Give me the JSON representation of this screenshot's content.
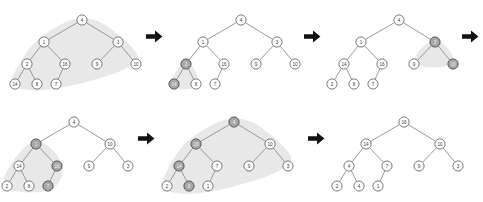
{
  "figure": {
    "colors": {
      "background": "#ffffff",
      "node_fill": "#ffffff",
      "node_stroke": "#6e6e6e",
      "node_fill_highlighted": "#a8a8a8",
      "node_label": "#3a3a3a",
      "node_label_highlighted": "#f2f2f2",
      "edge": "#8f8f8f",
      "blob": "#e6e6e6",
      "arrow": "#111111"
    },
    "arrows": [
      {
        "name": "arrow-1",
        "glyph": "right-arrow",
        "row": "top",
        "after_panel": 1
      },
      {
        "name": "arrow-2",
        "glyph": "right-arrow",
        "row": "top",
        "after_panel": 2
      },
      {
        "name": "arrow-3",
        "glyph": "right-arrow",
        "row": "top",
        "after_panel": 3
      },
      {
        "name": "arrow-4",
        "glyph": "right-arrow",
        "row": "bottom",
        "after_panel": 4
      },
      {
        "name": "arrow-5",
        "glyph": "right-arrow",
        "row": "bottom",
        "after_panel": 5
      }
    ]
  },
  "chart_data": {
    "type": "diagram",
    "panel_count": 6,
    "panels": [
      {
        "index": 1,
        "name": "panel-step-1",
        "row": "top",
        "highlighted": [
          "16",
          "7"
        ],
        "blob_region": "subtree rooted at 16",
        "nodes": [
          {
            "id": "n0",
            "label": "4",
            "x": 86,
            "y": 18,
            "highlight": false
          },
          {
            "id": "n1",
            "label": "1",
            "x": 48,
            "y": 40,
            "highlight": false
          },
          {
            "id": "n2",
            "label": "3",
            "x": 122,
            "y": 40,
            "highlight": false
          },
          {
            "id": "n3",
            "label": "2",
            "x": 31,
            "y": 62,
            "highlight": false
          },
          {
            "id": "n4",
            "label": "16",
            "x": 69,
            "y": 62,
            "highlight": false
          },
          {
            "id": "n5",
            "label": "9",
            "x": 101,
            "y": 62,
            "highlight": false
          },
          {
            "id": "n6",
            "label": "10",
            "x": 140,
            "y": 62,
            "highlight": false
          },
          {
            "id": "n7",
            "label": "14",
            "x": 19,
            "y": 82,
            "highlight": false
          },
          {
            "id": "n8",
            "label": "8",
            "x": 41,
            "y": 82,
            "highlight": false
          },
          {
            "id": "n9",
            "label": "7",
            "x": 60,
            "y": 82,
            "highlight": false
          }
        ],
        "edges": [
          [
            "n0",
            "n1"
          ],
          [
            "n0",
            "n2"
          ],
          [
            "n1",
            "n3"
          ],
          [
            "n1",
            "n4"
          ],
          [
            "n2",
            "n5"
          ],
          [
            "n2",
            "n6"
          ],
          [
            "n3",
            "n7"
          ],
          [
            "n3",
            "n8"
          ],
          [
            "n4",
            "n9"
          ]
        ]
      },
      {
        "index": 2,
        "name": "panel-step-2",
        "row": "top",
        "highlighted": [
          "2",
          "14"
        ],
        "blob_region": "subtree rooted at 2",
        "nodes": [
          {
            "id": "n0",
            "label": "4",
            "x": 86,
            "y": 18,
            "highlight": false
          },
          {
            "id": "n1",
            "label": "1",
            "x": 48,
            "y": 40,
            "highlight": false
          },
          {
            "id": "n2",
            "label": "3",
            "x": 122,
            "y": 40,
            "highlight": false
          },
          {
            "id": "n3",
            "label": "2",
            "x": 31,
            "y": 62,
            "highlight": true
          },
          {
            "id": "n4",
            "label": "16",
            "x": 69,
            "y": 62,
            "highlight": false
          },
          {
            "id": "n5",
            "label": "9",
            "x": 101,
            "y": 62,
            "highlight": false
          },
          {
            "id": "n6",
            "label": "10",
            "x": 140,
            "y": 62,
            "highlight": false
          },
          {
            "id": "n7",
            "label": "14",
            "x": 19,
            "y": 82,
            "highlight": true
          },
          {
            "id": "n8",
            "label": "8",
            "x": 41,
            "y": 82,
            "highlight": false
          },
          {
            "id": "n9",
            "label": "7",
            "x": 60,
            "y": 82,
            "highlight": false
          }
        ],
        "edges": [
          [
            "n0",
            "n1"
          ],
          [
            "n0",
            "n2"
          ],
          [
            "n1",
            "n3"
          ],
          [
            "n1",
            "n4"
          ],
          [
            "n2",
            "n5"
          ],
          [
            "n2",
            "n6"
          ],
          [
            "n3",
            "n7"
          ],
          [
            "n3",
            "n8"
          ],
          [
            "n4",
            "n9"
          ]
        ]
      },
      {
        "index": 3,
        "name": "panel-step-3",
        "row": "top",
        "highlighted": [
          "3",
          "10"
        ],
        "blob_region": "subtree rooted at 3",
        "nodes": [
          {
            "id": "n0",
            "label": "4",
            "x": 86,
            "y": 18,
            "highlight": false
          },
          {
            "id": "n1",
            "label": "1",
            "x": 48,
            "y": 40,
            "highlight": false
          },
          {
            "id": "n2",
            "label": "3",
            "x": 122,
            "y": 40,
            "highlight": true
          },
          {
            "id": "n3",
            "label": "14",
            "x": 31,
            "y": 62,
            "highlight": false
          },
          {
            "id": "n4",
            "label": "16",
            "x": 69,
            "y": 62,
            "highlight": false
          },
          {
            "id": "n5",
            "label": "9",
            "x": 101,
            "y": 62,
            "highlight": false
          },
          {
            "id": "n6",
            "label": "10",
            "x": 140,
            "y": 62,
            "highlight": true
          },
          {
            "id": "n7",
            "label": "2",
            "x": 19,
            "y": 82,
            "highlight": false
          },
          {
            "id": "n8",
            "label": "8",
            "x": 41,
            "y": 82,
            "highlight": false
          },
          {
            "id": "n9",
            "label": "7",
            "x": 60,
            "y": 82,
            "highlight": false
          }
        ],
        "edges": [
          [
            "n0",
            "n1"
          ],
          [
            "n0",
            "n2"
          ],
          [
            "n1",
            "n3"
          ],
          [
            "n1",
            "n4"
          ],
          [
            "n2",
            "n5"
          ],
          [
            "n2",
            "n6"
          ],
          [
            "n3",
            "n7"
          ],
          [
            "n3",
            "n8"
          ],
          [
            "n4",
            "n9"
          ]
        ]
      },
      {
        "index": 4,
        "name": "panel-step-4",
        "row": "bottom",
        "highlighted": [
          "1",
          "16",
          "7"
        ],
        "blob_region": "subtree rooted at 1",
        "nodes": [
          {
            "id": "n0",
            "label": "4",
            "x": 86,
            "y": 18,
            "highlight": false
          },
          {
            "id": "n1",
            "label": "1",
            "x": 48,
            "y": 40,
            "highlight": true
          },
          {
            "id": "n2",
            "label": "10",
            "x": 122,
            "y": 40,
            "highlight": false
          },
          {
            "id": "n3",
            "label": "14",
            "x": 31,
            "y": 62,
            "highlight": false
          },
          {
            "id": "n4",
            "label": "16",
            "x": 69,
            "y": 62,
            "highlight": true
          },
          {
            "id": "n5",
            "label": "9",
            "x": 101,
            "y": 62,
            "highlight": false
          },
          {
            "id": "n6",
            "label": "3",
            "x": 140,
            "y": 62,
            "highlight": false
          },
          {
            "id": "n7",
            "label": "2",
            "x": 19,
            "y": 82,
            "highlight": false
          },
          {
            "id": "n8",
            "label": "8",
            "x": 41,
            "y": 82,
            "highlight": false
          },
          {
            "id": "n9",
            "label": "7",
            "x": 60,
            "y": 82,
            "highlight": true
          }
        ],
        "edges": [
          [
            "n0",
            "n1"
          ],
          [
            "n0",
            "n2"
          ],
          [
            "n1",
            "n3"
          ],
          [
            "n1",
            "n4"
          ],
          [
            "n2",
            "n5"
          ],
          [
            "n2",
            "n6"
          ],
          [
            "n3",
            "n7"
          ],
          [
            "n3",
            "n8"
          ],
          [
            "n4",
            "n9"
          ]
        ]
      },
      {
        "index": 5,
        "name": "panel-step-5",
        "row": "bottom",
        "highlighted": [
          "4",
          "16",
          "14",
          "8"
        ],
        "blob_region": "whole tree",
        "nodes": [
          {
            "id": "n0",
            "label": "4",
            "x": 86,
            "y": 18,
            "highlight": true
          },
          {
            "id": "n1",
            "label": "16",
            "x": 48,
            "y": 40,
            "highlight": true
          },
          {
            "id": "n2",
            "label": "10",
            "x": 122,
            "y": 40,
            "highlight": false
          },
          {
            "id": "n3",
            "label": "14",
            "x": 31,
            "y": 62,
            "highlight": true
          },
          {
            "id": "n4",
            "label": "7",
            "x": 69,
            "y": 62,
            "highlight": false
          },
          {
            "id": "n5",
            "label": "9",
            "x": 101,
            "y": 62,
            "highlight": false
          },
          {
            "id": "n6",
            "label": "3",
            "x": 140,
            "y": 62,
            "highlight": false
          },
          {
            "id": "n7",
            "label": "2",
            "x": 19,
            "y": 82,
            "highlight": false
          },
          {
            "id": "n8",
            "label": "8",
            "x": 41,
            "y": 82,
            "highlight": true
          },
          {
            "id": "n9",
            "label": "1",
            "x": 60,
            "y": 82,
            "highlight": false
          }
        ],
        "edges": [
          [
            "n0",
            "n1"
          ],
          [
            "n0",
            "n2"
          ],
          [
            "n1",
            "n3"
          ],
          [
            "n1",
            "n4"
          ],
          [
            "n2",
            "n5"
          ],
          [
            "n2",
            "n6"
          ],
          [
            "n3",
            "n7"
          ],
          [
            "n3",
            "n8"
          ],
          [
            "n4",
            "n9"
          ]
        ]
      },
      {
        "index": 6,
        "name": "panel-step-6",
        "row": "bottom",
        "highlighted": [],
        "blob_region": "none",
        "nodes": [
          {
            "id": "n0",
            "label": "16",
            "x": 86,
            "y": 18,
            "highlight": false
          },
          {
            "id": "n1",
            "label": "14",
            "x": 48,
            "y": 40,
            "highlight": false
          },
          {
            "id": "n2",
            "label": "10",
            "x": 122,
            "y": 40,
            "highlight": false
          },
          {
            "id": "n3",
            "label": "4",
            "x": 31,
            "y": 62,
            "highlight": false
          },
          {
            "id": "n4",
            "label": "7",
            "x": 69,
            "y": 62,
            "highlight": false
          },
          {
            "id": "n5",
            "label": "9",
            "x": 101,
            "y": 62,
            "highlight": false
          },
          {
            "id": "n6",
            "label": "3",
            "x": 140,
            "y": 62,
            "highlight": false
          },
          {
            "id": "n7",
            "label": "2",
            "x": 19,
            "y": 82,
            "highlight": false
          },
          {
            "id": "n8",
            "label": "4",
            "x": 41,
            "y": 82,
            "highlight": false
          },
          {
            "id": "n9",
            "label": "1",
            "x": 60,
            "y": 82,
            "highlight": false
          }
        ],
        "edges": [
          [
            "n0",
            "n1"
          ],
          [
            "n0",
            "n2"
          ],
          [
            "n1",
            "n3"
          ],
          [
            "n1",
            "n4"
          ],
          [
            "n2",
            "n5"
          ],
          [
            "n2",
            "n6"
          ],
          [
            "n3",
            "n7"
          ],
          [
            "n3",
            "n8"
          ],
          [
            "n4",
            "n9"
          ]
        ]
      }
    ]
  }
}
